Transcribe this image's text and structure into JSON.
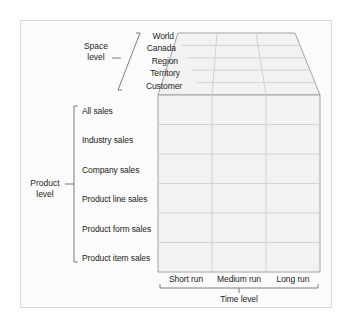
{
  "figure": {
    "kind": "data-cube-diagram",
    "frame_bg": "#fbfbfb",
    "frame_border": "#d8d8d8",
    "cell_fill": "#f2f2f2",
    "grid_line": "#c9c9c9",
    "edge_line": "#9a9a9a",
    "text_color": "#231f20"
  },
  "dimensions": {
    "space": {
      "group_label_line1": "Space",
      "group_label_line2": "level",
      "members": [
        "World",
        "Canada",
        "Region",
        "Territory",
        "Customer"
      ]
    },
    "product": {
      "group_label_line1": "Product",
      "group_label_line2": "level",
      "members": [
        "All sales",
        "Industry sales",
        "Company sales",
        "Product line sales",
        "Product form sales",
        "Product item sales"
      ]
    },
    "time": {
      "group_label": "Time level",
      "members": [
        "Short run",
        "Medium run",
        "Long run"
      ]
    }
  }
}
